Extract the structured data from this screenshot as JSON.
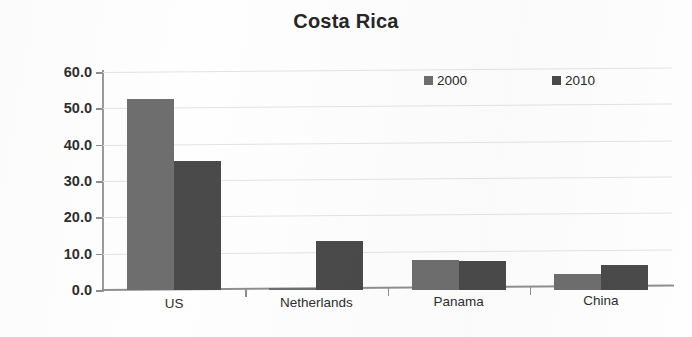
{
  "chart_data": {
    "type": "bar",
    "title": "Costa Rica",
    "subtitle": "",
    "xlabel": "",
    "ylabel": "",
    "categories": [
      "US",
      "Netherlands",
      "Panama",
      "China"
    ],
    "series": [
      {
        "name": "2000",
        "color": "#6e6e6e",
        "values": [
          52.5,
          0.5,
          8.2,
          4.3
        ]
      },
      {
        "name": "2010",
        "color": "#4a4a4a",
        "values": [
          35.5,
          13.5,
          8.0,
          7.0
        ]
      }
    ],
    "ylim": [
      0,
      60
    ],
    "ytick_values": [
      60,
      50,
      40,
      30,
      20,
      10,
      0
    ],
    "ytick_labels": [
      "60.0",
      "50.0",
      "40.0",
      "30.0",
      "20.0",
      "10.0",
      "0.0"
    ],
    "grid": true,
    "grid_axis": "y",
    "legend_position": "top-right",
    "legend_entries": [
      "2000",
      "2010"
    ],
    "background_color": "#ffffff",
    "gridline_color": "#e3e3e3",
    "axis_color": "#8f8f8f",
    "text_color": "#2b2b2b"
  }
}
